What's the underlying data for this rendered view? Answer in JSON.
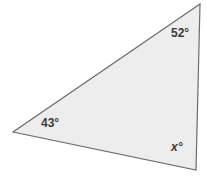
{
  "figure": {
    "type": "triangle-angle-diagram",
    "shape_name": "triangle",
    "fill_color": "#ededed",
    "stroke_color": "#6b6b6b",
    "stroke_width": 1.2,
    "background_color": "#ffffff",
    "label_color": "#3b3b3b",
    "vertices": [
      {
        "name": "top-right-vertex",
        "x": 200,
        "y": 4
      },
      {
        "name": "bottom-left-vertex",
        "x": 13,
        "y": 132
      },
      {
        "name": "bottom-right-vertex",
        "x": 196,
        "y": 170
      }
    ],
    "labels": {
      "top_angle": "52°",
      "left_angle": "43°",
      "bottom_right_angle": "x°"
    }
  },
  "chart_data": {
    "type": "diagram",
    "title": "",
    "shape": "triangle",
    "angles": [
      {
        "vertex": "top-right",
        "label": "52°",
        "value": 52,
        "known": true
      },
      {
        "vertex": "bottom-left",
        "label": "43°",
        "value": 43,
        "known": true
      },
      {
        "vertex": "bottom-right",
        "label": "x°",
        "value": null,
        "known": false
      }
    ],
    "polygon_points": [
      [
        200,
        4
      ],
      [
        13,
        132
      ],
      [
        196,
        170
      ]
    ]
  }
}
